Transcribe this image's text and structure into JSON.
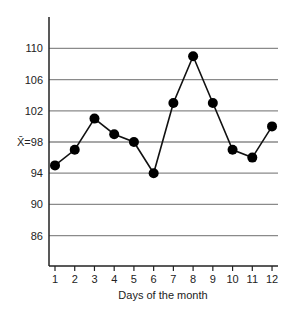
{
  "chart_data": {
    "type": "line",
    "title": "",
    "xlabel": "Days of the month",
    "ylabel": "",
    "categories": [
      "1",
      "2",
      "3",
      "4",
      "5",
      "6",
      "7",
      "8",
      "9",
      "10",
      "11",
      "12"
    ],
    "x": [
      1,
      2,
      3,
      4,
      5,
      6,
      7,
      8,
      9,
      10,
      11,
      12
    ],
    "series": [
      {
        "name": "Daily mean",
        "values": [
          95,
          97,
          101,
          99,
          98,
          94,
          103,
          109,
          103,
          97,
          96,
          100
        ]
      }
    ],
    "y_ticks": [
      86,
      90,
      94,
      98,
      102,
      106,
      110
    ],
    "y_tick_labels": [
      "86",
      "90",
      "94",
      "X̄=98",
      "102",
      "106",
      "110"
    ],
    "mean_label": "X̄=98",
    "mean_value": 98,
    "ylim": [
      82,
      114
    ],
    "xlim": [
      0.7,
      12.3
    ],
    "grid": "horizontal",
    "legend": "none",
    "colors": {
      "line": "#111111",
      "marker": "#000000",
      "grid": "#8a8a8a",
      "axis": "#222222"
    }
  }
}
